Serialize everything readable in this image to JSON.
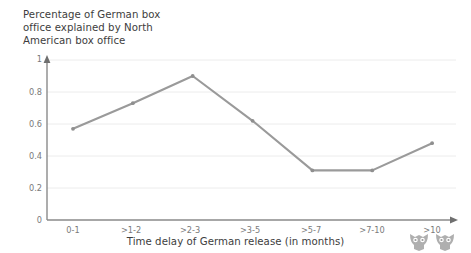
{
  "chart_data": {
    "type": "line",
    "title": "Percentage of German box\noffice explained by North\nAmerican box office",
    "xlabel": "Time delay of German release (in months)",
    "ylabel": "",
    "categories": [
      "0-1",
      ">1-2",
      ">2-3",
      ">3-5",
      ">5-7",
      ">7-10",
      ">10"
    ],
    "values": [
      0.57,
      0.73,
      0.9,
      0.62,
      0.31,
      0.31,
      0.48
    ],
    "series": [
      {
        "name": "Percentage of German box office explained by North American box office",
        "values": [
          0.57,
          0.73,
          0.9,
          0.62,
          0.31,
          0.31,
          0.48
        ]
      }
    ],
    "ylim": [
      0,
      1
    ],
    "yticks": [
      "0",
      "0.2",
      "0.4",
      "0.6",
      "0.8",
      "1"
    ],
    "ytick_values": [
      0,
      0.2,
      0.4,
      0.6,
      0.8,
      1
    ],
    "grid": true,
    "legend": false,
    "legend_position": "none",
    "line_color": "#9a9a9a",
    "marker_color": "#8f8f8f",
    "grid_color": "#ececec",
    "axis_color": "#8a8a8a",
    "background_color": "#ffffff"
  },
  "watermark": {
    "left_icon": "owl-mark-icon",
    "right_icon": "owl-mark-icon"
  }
}
